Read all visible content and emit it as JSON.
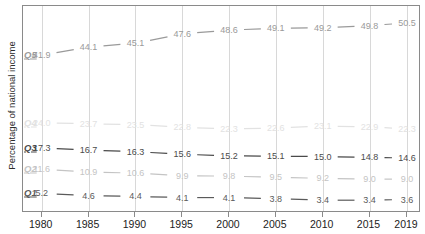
{
  "chart_data": {
    "type": "line",
    "title": "",
    "xlabel": "",
    "ylabel": "Percentage of national income",
    "categories": [
      "1980",
      "1985",
      "1990",
      "1995",
      "2000",
      "2005",
      "2010",
      "2015",
      "2019"
    ],
    "x": [
      1980,
      1985,
      1990,
      1995,
      2000,
      2005,
      2010,
      2015,
      2019
    ],
    "ylim": [
      0,
      55
    ],
    "xlim": [
      1978,
      2020.5
    ],
    "grid": "vertical",
    "legend": "inline-left-labels",
    "series": [
      {
        "name": "Q5",
        "label": "Q5",
        "color": "#9a9a9a",
        "values": [
          41.9,
          44.1,
          45.1,
          47.6,
          48.6,
          49.1,
          49.2,
          49.8,
          50.5
        ],
        "labels": [
          "41.9",
          "44.1",
          "45.1",
          "47.6",
          "48.6",
          "49.1",
          "49.2",
          "49.8",
          "50.5"
        ]
      },
      {
        "name": "Q4",
        "label": "Q4",
        "color": "#e2e2e2",
        "values": [
          24.0,
          23.7,
          23.5,
          22.8,
          22.3,
          22.6,
          23.1,
          22.9,
          22.3
        ],
        "labels": [
          "24.0",
          "23.7",
          "23.5",
          "22.8",
          "22.3",
          "22.6",
          "23.1",
          "22.9",
          "22.3"
        ]
      },
      {
        "name": "Q3",
        "label": "Q3",
        "color": "#4a4a4a",
        "values": [
          17.3,
          16.7,
          16.3,
          15.6,
          15.2,
          15.1,
          15.0,
          14.8,
          14.6
        ],
        "labels": [
          "17.3",
          "16.7",
          "16.3",
          "15.6",
          "15.2",
          "15.1",
          "15.0",
          "14.8",
          "14.6"
        ]
      },
      {
        "name": "Q2",
        "label": "Q2",
        "color": "#c4c4c4",
        "values": [
          11.6,
          10.9,
          10.6,
          9.9,
          9.8,
          9.5,
          9.2,
          9.0,
          9.0
        ],
        "labels": [
          "11.6",
          "10.9",
          "10.6",
          "9.9",
          "9.8",
          "9.5",
          "9.2",
          "9.0",
          "9.0"
        ]
      },
      {
        "name": "Q1",
        "label": "Q1",
        "color": "#5a5a5a",
        "values": [
          5.2,
          4.6,
          4.4,
          4.1,
          4.1,
          3.8,
          3.4,
          3.4,
          3.6
        ],
        "labels": [
          "5.2",
          "4.6",
          "4.4",
          "4.1",
          "4.1",
          "3.8",
          "3.4",
          "3.4",
          "3.6"
        ]
      }
    ]
  },
  "axis": {
    "y_title": "Percentage of national income"
  },
  "colors": {
    "frame": "#8a8a8a",
    "grid": "#d8d8d8",
    "background": "#ffffff"
  }
}
